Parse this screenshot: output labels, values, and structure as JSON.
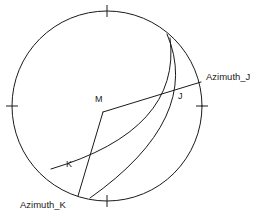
{
  "figure": {
    "type": "stereonet-diagram",
    "background_color": "#ffffff",
    "stroke_color": "#1a1a1a"
  },
  "primitive_circle": {
    "center_x": 107,
    "center_y": 106,
    "radius": 95,
    "tick_marks": [
      {
        "name": "north-tick",
        "angle_deg": 0
      },
      {
        "name": "east-tick",
        "angle_deg": 90
      },
      {
        "name": "south-tick",
        "angle_deg": 180
      },
      {
        "name": "west-tick",
        "angle_deg": 270
      }
    ]
  },
  "points": {
    "center": {
      "label": "M",
      "x": 103,
      "y": 112,
      "label_x": 95,
      "label_y": 95
    },
    "j": {
      "label": "J",
      "x": 173,
      "y": 91,
      "label_x": 178,
      "label_y": 92
    },
    "k": {
      "label": "K",
      "x": 80,
      "y": 174,
      "label_x": 66,
      "label_y": 160
    }
  },
  "azimuth_lines": [
    {
      "name": "azimuth-j",
      "label": "Azimuth_J",
      "label_x": 206,
      "label_y": 72,
      "from_x": 103,
      "from_y": 112,
      "to_x": 201,
      "to_y": 82
    },
    {
      "name": "azimuth-k",
      "label": "Azimuth_K",
      "label_x": 20,
      "label_y": 200,
      "from_x": 103,
      "from_y": 112,
      "to_x": 78,
      "to_y": 196
    }
  ],
  "great_circle_arcs": [
    {
      "name": "great-circle-arc-j",
      "start_x": 167,
      "start_y": 34,
      "end_x": 90,
      "end_y": 198,
      "bulge_x": 189,
      "bulge_y": 120
    },
    {
      "name": "great-circle-arc-k",
      "start_x": 170,
      "start_y": 38,
      "end_x": 51,
      "end_y": 169,
      "bulge_x": 171,
      "bulge_y": 128
    }
  ]
}
